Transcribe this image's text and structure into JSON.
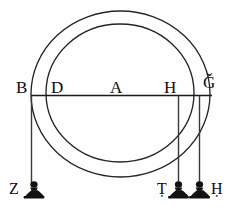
{
  "figure": {
    "background_color": "#fefefe",
    "ink_color": "#1a1a1a",
    "weight_fill_color": "#111111"
  },
  "circles": {
    "outer": {
      "name": "outer-circle",
      "cx": 120.5,
      "cy": 94.0,
      "rx": 89.5,
      "ry": 83.0
    },
    "inner": {
      "name": "inner-circle",
      "cx": 120.0,
      "cy": 93.0,
      "rx": 74.0,
      "ry": 69.0
    }
  },
  "beam": {
    "name": "horizontal-beam",
    "x1": 31,
    "y1": 95.5,
    "x2": 212,
    "y2": 95.5
  },
  "point_labels": [
    {
      "id": "B",
      "text": "B",
      "x": 16,
      "y": 79
    },
    {
      "id": "D",
      "text": "D",
      "x": 51,
      "y": 79
    },
    {
      "id": "A",
      "text": "A",
      "x": 110,
      "y": 79
    },
    {
      "id": "H",
      "text": "H",
      "x": 164,
      "y": 79
    },
    {
      "id": "G",
      "text": "Ǧ",
      "x": 203,
      "y": 74
    }
  ],
  "suspension_lines": [
    {
      "id": "line-B-Z",
      "x": 31,
      "y_top": 96,
      "y_bottom": 186
    },
    {
      "id": "line-H-T",
      "x": 178,
      "y_top": 96,
      "y_bottom": 186
    },
    {
      "id": "line-G-H",
      "x": 199,
      "y_top": 96,
      "y_bottom": 186
    }
  ],
  "weights": [
    {
      "id": "weight-Z",
      "x": 34,
      "y": 186
    },
    {
      "id": "weight-left",
      "x": 178,
      "y": 186
    },
    {
      "id": "weight-right",
      "x": 199,
      "y": 186
    }
  ],
  "weight_labels": [
    {
      "id": "Z",
      "text": "Z",
      "x": 9,
      "y": 182
    },
    {
      "id": "T",
      "text": "Ṭ",
      "x": 157,
      "y": 182
    },
    {
      "id": "H",
      "text": "Ḥ",
      "x": 211,
      "y": 182
    }
  ]
}
